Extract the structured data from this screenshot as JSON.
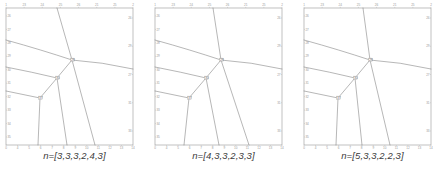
{
  "figure": {
    "background_color": "#ffffff",
    "line_color": "#6e6e6e",
    "frame_color": "#8d8d8d",
    "tick_label_color": "#9a9a9a",
    "caption_color": "#3a3a3a"
  },
  "panels": [
    {
      "id": "panel-1",
      "caption": "n=[3,3,3,2,4,3]",
      "axes": {
        "top_ticks": [
          "1",
          "23",
          "24",
          "25",
          "26",
          "21",
          "25",
          "2"
        ],
        "bottom_ticks": [
          "0",
          "4",
          "5",
          "6",
          "7",
          "8",
          "9",
          "10",
          "11",
          "12",
          "13",
          "14"
        ],
        "left_ticks": [
          "26",
          "27",
          "28",
          "29",
          "30",
          "31",
          "32",
          "33",
          "34",
          "35"
        ],
        "right_ticks": [
          "26",
          "29",
          "27",
          "31",
          "33"
        ]
      },
      "vertices": [
        {
          "label": "28",
          "x": 70,
          "y": 60
        },
        {
          "label": "30",
          "x": 55,
          "y": 78
        },
        {
          "label": "37",
          "x": 38,
          "y": 98
        }
      ]
    },
    {
      "id": "panel-2",
      "caption": "n=[4,3,3,2,3,3]",
      "axes": {
        "top_ticks": [
          "1",
          "23",
          "24",
          "25",
          "26",
          "21",
          "25",
          "2"
        ],
        "bottom_ticks": [
          "0",
          "4",
          "5",
          "6",
          "7",
          "8",
          "9",
          "10",
          "11",
          "12",
          "13",
          "14"
        ],
        "left_ticks": [
          "26",
          "27",
          "28",
          "29",
          "30",
          "31",
          "32",
          "33",
          "34",
          "35"
        ],
        "right_ticks": [
          "26",
          "29",
          "27",
          "31",
          "33"
        ]
      },
      "vertices": [
        {
          "label": "28",
          "x": 70,
          "y": 60
        },
        {
          "label": "30",
          "x": 55,
          "y": 78
        },
        {
          "label": "37",
          "x": 38,
          "y": 98
        }
      ]
    },
    {
      "id": "panel-3",
      "caption": "n=[5,3,3,2,2,3]",
      "axes": {
        "top_ticks": [
          "1",
          "23",
          "24",
          "25",
          "26",
          "21",
          "25",
          "2"
        ],
        "bottom_ticks": [
          "0",
          "4",
          "5",
          "6",
          "7",
          "8",
          "9",
          "10",
          "11",
          "12",
          "13",
          "14"
        ],
        "left_ticks": [
          "26",
          "27",
          "28",
          "29",
          "30",
          "31",
          "32",
          "33",
          "34",
          "35"
        ],
        "right_ticks": [
          "26",
          "29",
          "27",
          "31",
          "33"
        ]
      },
      "vertices": [
        {
          "label": "28",
          "x": 70,
          "y": 60
        },
        {
          "label": "30",
          "x": 55,
          "y": 78
        },
        {
          "label": "37",
          "x": 38,
          "y": 98
        }
      ]
    }
  ],
  "chart_data": {
    "type": "line",
    "title": "",
    "xlabel": "",
    "ylabel": "",
    "panel_count": 3,
    "panels": [
      {
        "name": "n=[3,3,3,2,4,3]",
        "nodes": [
          {
            "id": "A",
            "label": "28",
            "x": 70,
            "y": 60
          },
          {
            "id": "B",
            "label": "30",
            "x": 55,
            "y": 78
          },
          {
            "id": "C",
            "label": "37",
            "x": 38,
            "y": 98
          }
        ],
        "edges": [
          {
            "from": [
              55,
              4
            ],
            "to": [
              70,
              60
            ]
          },
          {
            "from": [
              70,
              60
            ],
            "to": [
              93,
              145
            ]
          },
          {
            "from": [
              70,
              60
            ],
            "to": [
              131,
              69
            ]
          },
          {
            "from": [
              70,
              60
            ],
            "to": [
              4,
              40
            ]
          },
          {
            "from": [
              70,
              60
            ],
            "to": [
              55,
              78
            ]
          },
          {
            "from": [
              55,
              78
            ],
            "to": [
              65,
              145
            ]
          },
          {
            "from": [
              55,
              78
            ],
            "to": [
              4,
              67
            ]
          },
          {
            "from": [
              55,
              78
            ],
            "to": [
              38,
              98
            ]
          },
          {
            "from": [
              38,
              98
            ],
            "to": [
              4,
              91
            ]
          },
          {
            "from": [
              38,
              98
            ],
            "to": [
              36,
              145
            ]
          }
        ]
      },
      {
        "name": "n=[4,3,3,2,3,3]",
        "nodes": [
          {
            "id": "A",
            "label": "28",
            "x": 70,
            "y": 60
          },
          {
            "id": "B",
            "label": "30",
            "x": 55,
            "y": 78
          },
          {
            "id": "C",
            "label": "37",
            "x": 38,
            "y": 98
          }
        ],
        "edges": [
          {
            "from": [
              62,
              4
            ],
            "to": [
              70,
              60
            ]
          },
          {
            "from": [
              70,
              60
            ],
            "to": [
              98,
              145
            ]
          },
          {
            "from": [
              70,
              60
            ],
            "to": [
              131,
              69
            ]
          },
          {
            "from": [
              70,
              60
            ],
            "to": [
              4,
              40
            ]
          },
          {
            "from": [
              70,
              60
            ],
            "to": [
              55,
              78
            ]
          },
          {
            "from": [
              55,
              78
            ],
            "to": [
              68,
              145
            ]
          },
          {
            "from": [
              55,
              78
            ],
            "to": [
              4,
              67
            ]
          },
          {
            "from": [
              55,
              78
            ],
            "to": [
              38,
              98
            ]
          },
          {
            "from": [
              38,
              98
            ],
            "to": [
              4,
              91
            ]
          },
          {
            "from": [
              38,
              98
            ],
            "to": [
              33,
              145
            ]
          }
        ]
      },
      {
        "name": "n=[5,3,3,2,2,3]",
        "nodes": [
          {
            "id": "A",
            "label": "28",
            "x": 70,
            "y": 60
          },
          {
            "id": "B",
            "label": "30",
            "x": 55,
            "y": 78
          },
          {
            "id": "C",
            "label": "37",
            "x": 38,
            "y": 98
          }
        ],
        "edges": [
          {
            "from": [
              63,
              4
            ],
            "to": [
              70,
              60
            ]
          },
          {
            "from": [
              70,
              60
            ],
            "to": [
              90,
              145
            ]
          },
          {
            "from": [
              70,
              60
            ],
            "to": [
              131,
              69
            ]
          },
          {
            "from": [
              70,
              60
            ],
            "to": [
              4,
              40
            ]
          },
          {
            "from": [
              70,
              60
            ],
            "to": [
              55,
              78
            ]
          },
          {
            "from": [
              55,
              78
            ],
            "to": [
              62,
              145
            ]
          },
          {
            "from": [
              55,
              78
            ],
            "to": [
              4,
              67
            ]
          },
          {
            "from": [
              55,
              78
            ],
            "to": [
              38,
              98
            ]
          },
          {
            "from": [
              38,
              98
            ],
            "to": [
              4,
              91
            ]
          },
          {
            "from": [
              38,
              98
            ],
            "to": [
              36,
              145
            ]
          }
        ]
      }
    ]
  }
}
